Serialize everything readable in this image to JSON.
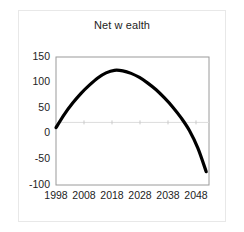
{
  "chart_data": {
    "type": "line",
    "title": "Net w ealth",
    "xlabel": "",
    "ylabel": "",
    "xlim": [
      1998,
      2053
    ],
    "ylim": [
      -100,
      150
    ],
    "grid": false,
    "zero_line": true,
    "legend": "none",
    "xticks": [
      "1998",
      "2008",
      "2018",
      "2028",
      "2038",
      "2048"
    ],
    "xtick_values": [
      1998,
      2008,
      2018,
      2028,
      2038,
      2048
    ],
    "yticks": [
      "150",
      "100",
      "50",
      "0",
      "-50",
      "-100"
    ],
    "ytick_values": [
      150,
      100,
      50,
      0,
      -50,
      -100
    ],
    "series": [
      {
        "name": "Net wealth",
        "color": "#000000",
        "x": [
          1998,
          2001,
          2004,
          2007,
          2010,
          2013,
          2016,
          2019,
          2022,
          2025,
          2028,
          2031,
          2034,
          2037,
          2040,
          2043,
          2046,
          2049,
          2052
        ],
        "values": [
          12,
          38,
          60,
          79,
          95,
          109,
          119,
          124,
          123,
          118,
          110,
          99,
          86,
          70,
          52,
          31,
          6,
          -28,
          -74
        ]
      }
    ]
  },
  "axes": {
    "x_axis_name": "year-axis",
    "y_axis_name": "value-axis"
  }
}
